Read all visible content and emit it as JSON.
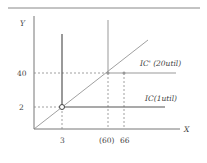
{
  "diagram": {
    "type": "indifference-curves-perfect-complements",
    "axes": {
      "x_label": "X",
      "y_label": "Y"
    },
    "x_ticks": [
      "3",
      "(60)",
      "66"
    ],
    "y_ticks": [
      "40",
      "2"
    ],
    "curves": [
      {
        "name": "IC'",
        "label": "IC' (20util)",
        "corner": [
          60,
          40
        ]
      },
      {
        "name": "IC",
        "label": "IC(1util)",
        "corner": [
          3,
          2
        ]
      }
    ],
    "ray": "diagonal through origin",
    "colors": {
      "axis": "#777777",
      "ic_dark": "#555555",
      "ic_light": "#999999",
      "dashed": "#888888"
    }
  }
}
